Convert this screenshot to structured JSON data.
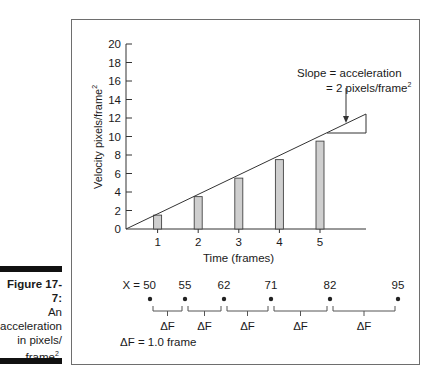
{
  "caption": {
    "title": "Figure 17-7:",
    "line1": "An",
    "line2": "acceleration",
    "line3": "in pixels/",
    "line4": "frame",
    "line4_sup": "2",
    "line4_end": "."
  },
  "annotation": {
    "line1": "Slope = acceleration",
    "line2": "= 2 pixels/frame",
    "line2_sup": "2"
  },
  "position_line": {
    "prefix": "X = ",
    "values": [
      "50",
      "55",
      "62",
      "71",
      "82",
      "95"
    ],
    "interval_label": "ΔF",
    "legend": "ΔF = 1.0 frame"
  },
  "chart_data": {
    "type": "bar",
    "title": "",
    "xlabel": "Time (frames)",
    "ylabel": "Velocity pixels/frame²",
    "ylabel_main": "Velocity pixels/frame",
    "ylabel_sup": "2",
    "x_ticks": [
      "1",
      "2",
      "3",
      "4",
      "5"
    ],
    "y_ticks": [
      "0",
      "2",
      "4",
      "6",
      "8",
      "10",
      "12",
      "14",
      "16",
      "18",
      "20"
    ],
    "ylim": [
      0,
      20
    ],
    "xlim": [
      0,
      6
    ],
    "grid": false,
    "categories": [
      "1",
      "2",
      "3",
      "4",
      "5"
    ],
    "values": [
      1.5,
      3.5,
      5.5,
      7.5,
      9.5
    ],
    "series": [
      {
        "name": "velocity bars",
        "type": "bar",
        "values": [
          1.5,
          3.5,
          5.5,
          7.5,
          9.5
        ]
      },
      {
        "name": "velocity line",
        "type": "line",
        "x": [
          0,
          5.3
        ],
        "y": [
          0,
          10.6
        ]
      }
    ],
    "slope": 2,
    "positions": [
      50,
      55,
      62,
      71,
      82,
      95
    ],
    "delta_frame": 1.0
  }
}
